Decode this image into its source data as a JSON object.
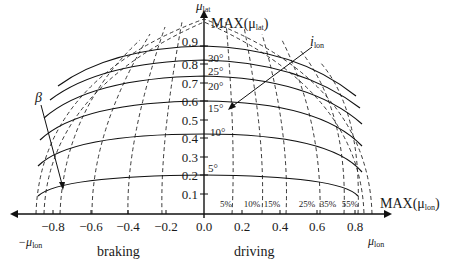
{
  "diagram": {
    "y_axis": {
      "label": "μ",
      "label_sub": "lat",
      "max_label": "MAX(μ",
      "max_label_sub": "lat",
      "max_label_close": ")"
    },
    "x_axis": {
      "label": "μ",
      "label_sub": "lon",
      "neg_label": "−μ",
      "neg_label_sub": "lon",
      "max_label": "MAX(μ",
      "max_label_sub": "lon",
      "max_label_close": ")"
    },
    "y_ticks": [
      "0.1",
      "0.2",
      "0.3",
      "0.4",
      "0.5",
      "0.6",
      "0.7",
      "0.8",
      "0.9"
    ],
    "x_ticks": [
      "−0.8",
      "−0.6",
      "−0.4",
      "−0.2",
      "0.0",
      "0.2",
      "0.4",
      "0.6",
      "0.8"
    ],
    "angle_labels": [
      "5°",
      "10°",
      "15°",
      "20°",
      "25°",
      "30°"
    ],
    "slip_labels": [
      "5%",
      "10%",
      "15%",
      "25%",
      "35%",
      "55%"
    ],
    "beta_label": "β",
    "i_lon_label": "i",
    "i_lon_sub": "lon",
    "region_labels": {
      "braking": "braking",
      "driving": "driving"
    }
  }
}
